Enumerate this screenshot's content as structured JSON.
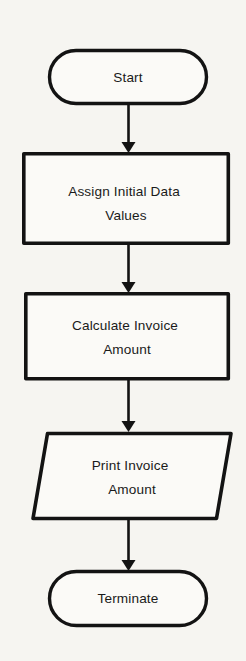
{
  "diagram": {
    "type": "flowchart",
    "orientation": "vertical",
    "background_color": "#f6f5f1",
    "stroke_color": "#131313",
    "fill_color": "#fbfaf7",
    "text_color": "#1a1a1a"
  },
  "nodes": [
    {
      "id": "start",
      "shape": "terminator",
      "label": "Start",
      "lines": [
        "Start"
      ],
      "x": 48,
      "y": 49,
      "width": 159,
      "height": 55
    },
    {
      "id": "assign",
      "shape": "process",
      "label": "Assign Initial Data Values",
      "lines": [
        "Assign Initial Data",
        "Values"
      ],
      "x": 22,
      "y": 152,
      "width": 208,
      "height": 93
    },
    {
      "id": "calculate",
      "shape": "process",
      "label": "Calculate Invoice Amount",
      "lines": [
        "Calculate Invoice",
        "Amount"
      ],
      "x": 24,
      "y": 292,
      "width": 206,
      "height": 88
    },
    {
      "id": "print",
      "shape": "input-output",
      "label": "Print Invoice Amount",
      "lines": [
        "Print Invoice",
        "Amount"
      ],
      "x": 32,
      "y": 432,
      "width": 200,
      "height": 88
    },
    {
      "id": "terminate",
      "shape": "terminator",
      "label": "Terminate",
      "lines": [
        "Terminate"
      ],
      "x": 48,
      "y": 570,
      "width": 159,
      "height": 57
    }
  ],
  "connectors": [
    {
      "id": "start-to-assign",
      "from": "start",
      "to": "assign",
      "direction": "down",
      "arrowhead": "filled-triangle"
    },
    {
      "id": "assign-to-calculate",
      "from": "assign",
      "to": "calculate",
      "direction": "down",
      "arrowhead": "filled-triangle"
    },
    {
      "id": "calculate-to-print",
      "from": "calculate",
      "to": "print",
      "direction": "down",
      "arrowhead": "filled-triangle"
    },
    {
      "id": "print-to-terminate",
      "from": "print",
      "to": "terminate",
      "direction": "down",
      "arrowhead": "filled-triangle"
    }
  ]
}
